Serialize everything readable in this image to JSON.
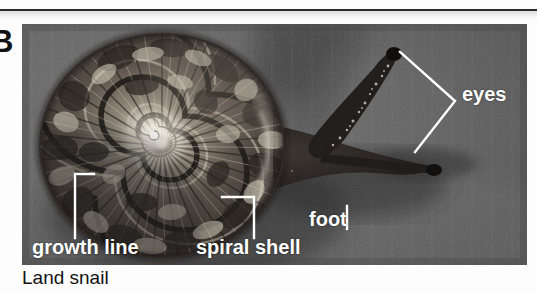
{
  "figure": {
    "panel_letter": "B",
    "caption": "Land snail"
  },
  "photo": {
    "background_color": "#5d5d5d",
    "shell_color": "#4a4038",
    "body_color": "#241f1c",
    "leader_color": "#ffffff"
  },
  "labels": {
    "growth_line": "growth line",
    "spiral_shell": "spiral shell",
    "foot": "foot",
    "eyes": "eyes"
  },
  "colors": {
    "rule": "#2b2b2b",
    "label_text": "#ffffff",
    "caption_text": "#121212",
    "page_background": "#fdfdfd"
  }
}
